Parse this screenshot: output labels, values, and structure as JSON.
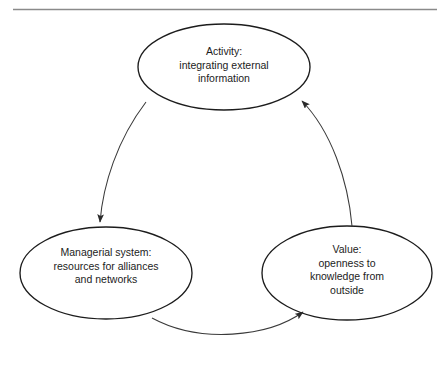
{
  "figure": {
    "type": "cycle-diagram",
    "orientation": "clockwise",
    "background_color": "#ffffff",
    "stroke_color": "#1c1c1c",
    "arrow_color": "#3a3a3a",
    "text_color": "#1c1c1c",
    "top_rule_color": "#8a8a8a"
  },
  "nodes": [
    {
      "id": "activity",
      "name": "activity-node",
      "shape": "ellipse",
      "label": "Activity:\nintegrating external\ninformation",
      "lines": [
        "Activity:",
        "integrating external",
        "information"
      ],
      "center": [
        224,
        67
      ],
      "radius": [
        86,
        43
      ]
    },
    {
      "id": "managerial-system",
      "name": "managerial-system-node",
      "shape": "ellipse",
      "label": "Managerial system:\nresources for alliances\nand networks",
      "lines": [
        "Managerial system:",
        "resources for alliances",
        "and networks"
      ],
      "center": [
        106,
        273
      ],
      "radius": [
        86,
        46
      ]
    },
    {
      "id": "value",
      "name": "value-node",
      "shape": "ellipse",
      "label": "Value:\nopenness to\nknowledge from\noutside",
      "lines": [
        "Value:",
        "openness to",
        "knowledge from",
        "outside"
      ],
      "center": [
        347,
        273
      ],
      "radius": [
        85,
        47
      ]
    }
  ],
  "edges": [
    {
      "id": "activity-to-managerial",
      "name": "arrow-activity-to-managerial-system",
      "from": "activity",
      "to": "managerial-system",
      "direction": "down-left",
      "arrowhead": "end"
    },
    {
      "id": "managerial-to-value",
      "name": "arrow-managerial-system-to-value",
      "from": "managerial-system",
      "to": "value",
      "direction": "right",
      "arrowhead": "end"
    },
    {
      "id": "value-to-activity",
      "name": "arrow-value-to-activity",
      "from": "value",
      "to": "activity",
      "direction": "up-left",
      "arrowhead": "end"
    }
  ]
}
